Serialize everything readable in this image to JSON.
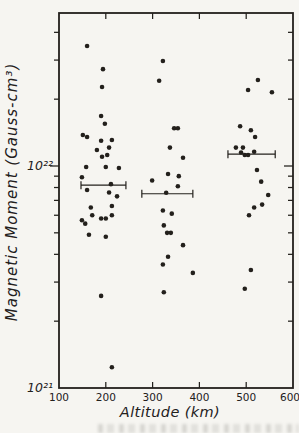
{
  "figure": {
    "background_color": "#f6f5f1",
    "ink_color": "#23201c"
  },
  "chart_data": {
    "type": "scatter",
    "title": "",
    "xlabel": "Altitude (km)",
    "ylabel": "Magnetic Moment (Gauss-cm³)",
    "grid": false,
    "legend": "none",
    "x_axis": {
      "min": 100,
      "max": 600,
      "ticks": [
        100,
        200,
        300,
        400,
        500,
        600
      ]
    },
    "y_axis": {
      "scale": "log",
      "min": 1e+21,
      "max": 4.9e+22,
      "major_ticks": [
        {
          "value": 1e+21,
          "label": "10²¹"
        },
        {
          "value": 1e+22,
          "label": "10²²"
        }
      ],
      "minor_ticks": [
        2e+21,
        3e+21,
        4e+21,
        5e+21,
        6e+21,
        7e+21,
        8e+21,
        9e+21,
        2e+22,
        3e+22,
        4e+22
      ]
    },
    "marker": {
      "shape": "dot",
      "color": "#23201c",
      "radius_px": 2.3
    },
    "series": [
      {
        "name": "magnetic-moment-measurements",
        "points": [
          [
            160,
            3.47e+22
          ],
          [
            194,
            2.73e+22
          ],
          [
            192,
            2.27e+22
          ],
          [
            190,
            1.68e+22
          ],
          [
            198,
            1.55e+22
          ],
          [
            151,
            1.38e+22
          ],
          [
            160,
            1.35e+22
          ],
          [
            213,
            1.31e+22
          ],
          [
            190,
            1.3e+22
          ],
          [
            207,
            1.21e+22
          ],
          [
            181,
            1.18e+22
          ],
          [
            203,
            1.12e+22
          ],
          [
            192,
            1.1e+22
          ],
          [
            158,
            9.9e+21
          ],
          [
            200,
            9.9e+21
          ],
          [
            228,
            9.8e+21
          ],
          [
            149,
            8.9e+21
          ],
          [
            160,
            7.8e+21
          ],
          [
            207,
            7.6e+21
          ],
          [
            224,
            7.3e+21
          ],
          [
            213,
            6.6e+21
          ],
          [
            168,
            6.5e+21
          ],
          [
            171,
            6e+21
          ],
          [
            213,
            6e+21
          ],
          [
            190,
            5.8e+21
          ],
          [
            200,
            5.8e+21
          ],
          [
            149,
            5.7e+21
          ],
          [
            156,
            5.5e+21
          ],
          [
            164,
            4.9e+21
          ],
          [
            200,
            4.8e+21
          ],
          [
            190,
            2.6e+21
          ],
          [
            213,
            1.24e+21
          ],
          [
            322,
            2.97e+22
          ],
          [
            314,
            2.42e+22
          ],
          [
            346,
            1.48e+22
          ],
          [
            354,
            1.48e+22
          ],
          [
            337,
            1.21e+22
          ],
          [
            365,
            1.09e+22
          ],
          [
            333,
            9.2e+21
          ],
          [
            356,
            9e+21
          ],
          [
            299,
            8.6e+21
          ],
          [
            354,
            8.1e+21
          ],
          [
            322,
            6.3e+21
          ],
          [
            341,
            6.1e+21
          ],
          [
            324,
            5.4e+21
          ],
          [
            331,
            5e+21
          ],
          [
            339,
            5e+21
          ],
          [
            365,
            4.4e+21
          ],
          [
            333,
            3.9e+21
          ],
          [
            322,
            3.6e+21
          ],
          [
            386,
            3.3e+21
          ],
          [
            324,
            2.7e+21
          ],
          [
            525,
            2.44e+22
          ],
          [
            504,
            2.2e+22
          ],
          [
            555,
            2.15e+22
          ],
          [
            487,
            1.51e+22
          ],
          [
            510,
            1.45e+22
          ],
          [
            519,
            1.35e+22
          ],
          [
            478,
            1.21e+22
          ],
          [
            493,
            1.21e+22
          ],
          [
            489,
            1.15e+22
          ],
          [
            517,
            1.16e+22
          ],
          [
            497,
            1.12e+22
          ],
          [
            504,
            1.12e+22
          ],
          [
            523,
            9.6e+21
          ],
          [
            532,
            8.5e+21
          ],
          [
            547,
            7.4e+21
          ],
          [
            534,
            6.7e+21
          ],
          [
            517,
            6.5e+21
          ],
          [
            506,
            6e+21
          ],
          [
            510,
            3.4e+21
          ],
          [
            497,
            2.8e+21
          ]
        ]
      }
    ],
    "error_bars": [
      {
        "moment": 8.2e+21,
        "alt_min": 147,
        "alt_max": 243,
        "alt_center": 211
      },
      {
        "moment": 7.5e+21,
        "alt_min": 277,
        "alt_max": 386,
        "alt_center": 329
      },
      {
        "moment": 1.13e+22,
        "alt_min": 461,
        "alt_max": 562,
        "alt_center": null
      }
    ]
  }
}
